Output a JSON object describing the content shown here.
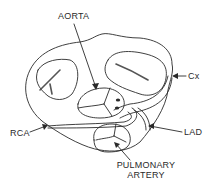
{
  "diagram": {
    "type": "anatomical cross-section",
    "labels": {
      "aorta": "AORTA",
      "cx": "Cx",
      "rca": "RCA",
      "lad": "LAD",
      "pulmonary_line1": "PULMONARY",
      "pulmonary_line2": "ARTERY"
    },
    "colors": {
      "stroke": "#2a2a2a",
      "background": "#ffffff",
      "hatch": "#555555"
    }
  }
}
